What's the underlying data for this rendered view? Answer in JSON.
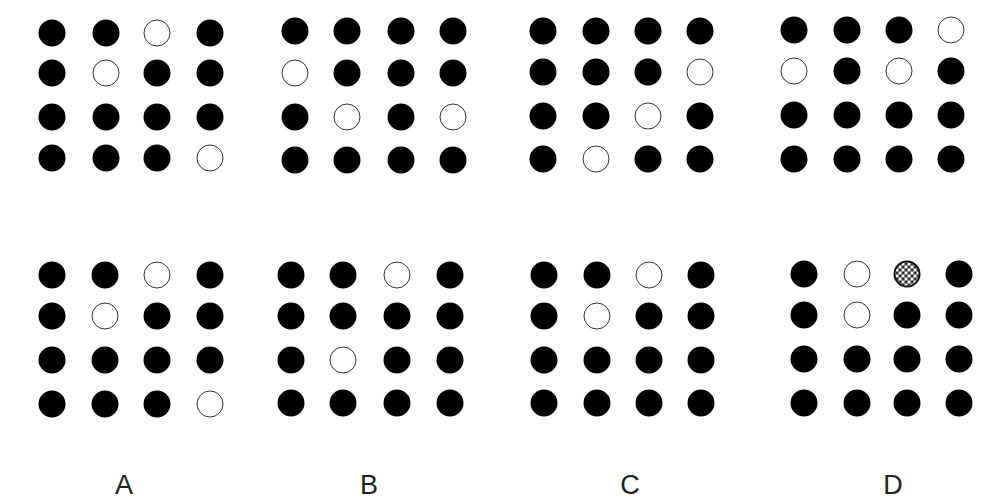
{
  "puzzle": {
    "question_row": [
      {
        "id": "q1",
        "cols_x": [
          52,
          106,
          157,
          210
        ],
        "rows_y": [
          33,
          73,
          117,
          158
        ],
        "cells": [
          [
            "filled",
            "filled",
            "hollow",
            "filled"
          ],
          [
            "filled",
            "hollow",
            "filled",
            "filled"
          ],
          [
            "filled",
            "filled",
            "filled",
            "filled"
          ],
          [
            "filled",
            "filled",
            "filled",
            "hollow"
          ]
        ]
      },
      {
        "id": "q2",
        "cols_x": [
          295,
          347,
          401,
          453
        ],
        "rows_y": [
          31,
          73,
          117,
          160
        ],
        "cells": [
          [
            "filled",
            "filled",
            "filled",
            "filled"
          ],
          [
            "hollow",
            "filled",
            "filled",
            "filled"
          ],
          [
            "filled",
            "hollow",
            "filled",
            "hollow"
          ],
          [
            "filled",
            "filled",
            "filled",
            "filled"
          ]
        ]
      },
      {
        "id": "q3",
        "cols_x": [
          543,
          596,
          648,
          700
        ],
        "rows_y": [
          31,
          72,
          116,
          159
        ],
        "cells": [
          [
            "filled",
            "filled",
            "filled",
            "filled"
          ],
          [
            "filled",
            "filled",
            "filled",
            "hollow"
          ],
          [
            "filled",
            "filled",
            "hollow",
            "filled"
          ],
          [
            "filled",
            "hollow",
            "filled",
            "filled"
          ]
        ]
      },
      {
        "id": "q4",
        "cols_x": [
          794,
          847,
          899,
          951
        ],
        "rows_y": [
          30,
          71,
          115,
          159
        ],
        "cells": [
          [
            "filled",
            "filled",
            "filled",
            "hollow"
          ],
          [
            "hollow",
            "filled",
            "hollow",
            "filled"
          ],
          [
            "filled",
            "filled",
            "filled",
            "filled"
          ],
          [
            "filled",
            "filled",
            "filled",
            "filled"
          ]
        ]
      }
    ],
    "answer_row": [
      {
        "id": "A",
        "label": "A",
        "label_x": 124,
        "cols_x": [
          52,
          105,
          157,
          210
        ],
        "rows_y": [
          275,
          316,
          360,
          404
        ],
        "cells": [
          [
            "filled",
            "filled",
            "hollow",
            "filled"
          ],
          [
            "filled",
            "hollow",
            "filled",
            "filled"
          ],
          [
            "filled",
            "filled",
            "filled",
            "filled"
          ],
          [
            "filled",
            "filled",
            "filled",
            "hollow"
          ]
        ]
      },
      {
        "id": "B",
        "label": "B",
        "label_x": 369,
        "cols_x": [
          291,
          343,
          397,
          450
        ],
        "rows_y": [
          275,
          316,
          360,
          403
        ],
        "cells": [
          [
            "filled",
            "filled",
            "hollow",
            "filled"
          ],
          [
            "filled",
            "filled",
            "filled",
            "filled"
          ],
          [
            "filled",
            "hollow",
            "filled",
            "filled"
          ],
          [
            "filled",
            "filled",
            "filled",
            "filled"
          ]
        ]
      },
      {
        "id": "C",
        "label": "C",
        "label_x": 630,
        "cols_x": [
          544,
          597,
          649,
          701
        ],
        "rows_y": [
          275,
          316,
          360,
          403
        ],
        "cells": [
          [
            "filled",
            "filled",
            "hollow",
            "filled"
          ],
          [
            "filled",
            "hollow",
            "filled",
            "filled"
          ],
          [
            "filled",
            "filled",
            "filled",
            "filled"
          ],
          [
            "filled",
            "filled",
            "filled",
            "filled"
          ]
        ]
      },
      {
        "id": "D",
        "label": "D",
        "label_x": 893,
        "cols_x": [
          804,
          857,
          907,
          959
        ],
        "rows_y": [
          274,
          315,
          359,
          403
        ],
        "cells": [
          [
            "filled",
            "hollow",
            "checkered",
            "filled"
          ],
          [
            "filled",
            "hollow",
            "filled",
            "filled"
          ],
          [
            "filled",
            "filled",
            "filled",
            "filled"
          ],
          [
            "filled",
            "filled",
            "filled",
            "filled"
          ]
        ]
      }
    ],
    "labels_y": 485,
    "colors": {
      "filled": "#000000",
      "hollow_stroke": "#333333",
      "background": "#ffffff",
      "label_text": "#222222"
    }
  }
}
